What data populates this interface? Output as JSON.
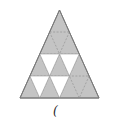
{
  "figure": {
    "caption": "(",
    "fill_color": "#c4c4c4",
    "edge_color": "#8a8a8a",
    "hole_color": "#ffffff",
    "rows": 4,
    "white_triangles": [
      {
        "row": 3,
        "index": 1
      },
      {
        "row": 3,
        "index": 2
      },
      {
        "row": 4,
        "index": 1
      },
      {
        "row": 4,
        "index": 2
      }
    ]
  }
}
